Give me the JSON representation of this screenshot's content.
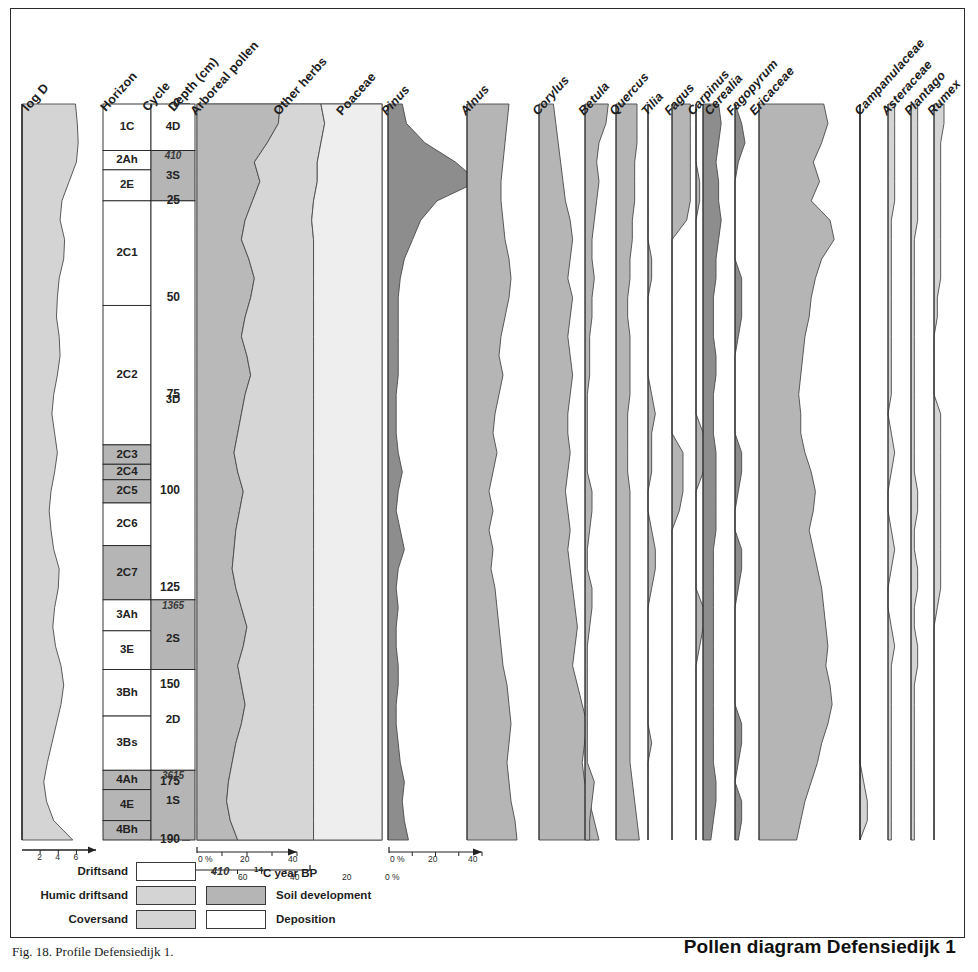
{
  "figure": {
    "title": "Pollen diagram Defensiedijk 1",
    "caption": "Fig. 18. Profile Defensiedijk 1.",
    "width": 978,
    "height": 972
  },
  "colors": {
    "arboreal_fill": "#b9b9b9",
    "herbs_fill": "#d6d6d6",
    "poaceae_fill": "#eeeeee",
    "dark_fill": "#8d8d8d",
    "mid_fill": "#b5b5b5",
    "light_fill": "#d4d4d4",
    "white_fill": "#ffffff",
    "stroke": "#4a4a4a",
    "axis": "#222222"
  },
  "depth_axis": {
    "label": "Depth (cm)",
    "unit": "cm",
    "min": 0,
    "max": 190,
    "ticks": [
      0,
      25,
      50,
      75,
      100,
      125,
      150,
      175,
      190
    ],
    "minor_step": 5
  },
  "logd_axis": {
    "label": "log D",
    "ticks": [
      2,
      4,
      6
    ],
    "min": 0,
    "max": 7.5
  },
  "percent_axes": [
    {
      "name": "sum-axis-left",
      "labels": [
        "0 %",
        "20",
        "40"
      ],
      "direction": "right"
    },
    {
      "name": "sum-axis-reverse",
      "labels": [
        "60",
        "40",
        "20",
        "0 %"
      ],
      "direction": "left"
    },
    {
      "name": "pinus-axis",
      "labels": [
        "0 %",
        "20",
        "40"
      ],
      "direction": "right"
    }
  ],
  "strat_columns": {
    "horizon_header": "Horizon",
    "cycle_header": "Cycle",
    "horizons": [
      {
        "label": "1C",
        "top": 0,
        "bottom": 12,
        "fill": "white"
      },
      {
        "label": "2Ah",
        "top": 12,
        "bottom": 17,
        "fill": "white"
      },
      {
        "label": "2E",
        "top": 17,
        "bottom": 25,
        "fill": "white"
      },
      {
        "label": "2C1",
        "top": 25,
        "bottom": 52,
        "fill": "white"
      },
      {
        "label": "2C2",
        "top": 52,
        "bottom": 88,
        "fill": "white"
      },
      {
        "label": "2C3",
        "top": 88,
        "bottom": 93,
        "fill": "grey"
      },
      {
        "label": "2C4",
        "top": 93,
        "bottom": 97,
        "fill": "grey"
      },
      {
        "label": "2C5",
        "top": 97,
        "bottom": 103,
        "fill": "grey"
      },
      {
        "label": "2C6",
        "top": 103,
        "bottom": 114,
        "fill": "white"
      },
      {
        "label": "2C7",
        "top": 114,
        "bottom": 128,
        "fill": "grey"
      },
      {
        "label": "3Ah",
        "top": 128,
        "bottom": 136,
        "fill": "white"
      },
      {
        "label": "3E",
        "top": 136,
        "bottom": 146,
        "fill": "white"
      },
      {
        "label": "3Bh",
        "top": 146,
        "bottom": 158,
        "fill": "white"
      },
      {
        "label": "3Bs",
        "top": 158,
        "bottom": 172,
        "fill": "white"
      },
      {
        "label": "4Ah",
        "top": 172,
        "bottom": 177,
        "fill": "grey"
      },
      {
        "label": "4E",
        "top": 177,
        "bottom": 185,
        "fill": "grey"
      },
      {
        "label": "4Bh",
        "top": 185,
        "bottom": 190,
        "fill": "grey"
      }
    ],
    "cycles": [
      {
        "label": "4D",
        "top": 0,
        "bottom": 12,
        "fill": "white"
      },
      {
        "label": "3S",
        "top": 12,
        "bottom": 25,
        "fill": "grey"
      },
      {
        "label": "3D",
        "top": 25,
        "bottom": 128,
        "fill": "white"
      },
      {
        "label": "2S",
        "top": 128,
        "bottom": 146,
        "fill": "grey"
      },
      {
        "label": "2D",
        "top": 146,
        "bottom": 172,
        "fill": "white"
      },
      {
        "label": "1S",
        "top": 172,
        "bottom": 190,
        "fill": "grey"
      }
    ],
    "c14_dates": [
      {
        "value": "410",
        "depth": 13.5
      },
      {
        "value": "1365",
        "depth": 129.5
      },
      {
        "value": "3615",
        "depth": 173.5
      }
    ]
  },
  "legend": {
    "rows": [
      {
        "left_label": "Driftsand",
        "left_fill": "white",
        "right_fill": null,
        "right_label": ""
      },
      {
        "left_label": "Humic driftsand",
        "left_fill": "light",
        "right_fill": "mid",
        "right_label": "Soil development"
      },
      {
        "left_label": "Coversand",
        "left_fill": "light",
        "right_fill": "white",
        "right_label": "Deposition"
      }
    ],
    "c14_value": "410",
    "c14_label": "14C year BP",
    "c14_sup": "14"
  },
  "chart_data": {
    "type": "area",
    "title": "Pollen diagram Defensiedijk 1",
    "xlabel": "percentage (%)",
    "ylabel": "Depth (cm)",
    "ylim": [
      0,
      190
    ],
    "y_inverted": true,
    "depths": [
      0,
      5,
      10,
      15,
      20,
      25,
      30,
      35,
      40,
      45,
      50,
      55,
      60,
      65,
      70,
      75,
      80,
      85,
      90,
      95,
      100,
      105,
      110,
      115,
      120,
      125,
      130,
      135,
      140,
      145,
      150,
      155,
      160,
      165,
      170,
      175,
      180,
      185,
      190
    ],
    "curves": [
      {
        "name": "log D",
        "group": "sediment",
        "kind": "line-area",
        "fill": "light",
        "max": 7.5,
        "values": [
          5.9,
          6.1,
          6.2,
          6.0,
          5.2,
          4.4,
          4.2,
          4.7,
          4.6,
          4.1,
          3.9,
          3.8,
          4.1,
          4.2,
          3.9,
          3.5,
          3.3,
          3.6,
          3.9,
          3.6,
          3.2,
          3.0,
          3.2,
          3.5,
          4.1,
          4.0,
          3.6,
          3.4,
          3.7,
          4.3,
          4.6,
          4.3,
          3.8,
          3.3,
          2.8,
          2.4,
          2.7,
          3.5,
          5.6
        ]
      },
      {
        "name": "Arboreal pollen",
        "group": "sum",
        "kind": "cumulative",
        "fill": "arboreal",
        "max": 100,
        "values": [
          45,
          44,
          38,
          31,
          34,
          30,
          26,
          24,
          28,
          31,
          29,
          26,
          24,
          27,
          29,
          26,
          24,
          22,
          20,
          22,
          25,
          23,
          21,
          20,
          19,
          21,
          24,
          27,
          25,
          22,
          24,
          26,
          24,
          21,
          19,
          17,
          16,
          18,
          22
        ]
      },
      {
        "name": "Other herbs",
        "group": "sum",
        "kind": "cumulative",
        "fill": "herbs",
        "max": 100,
        "values": [
          22,
          25,
          29,
          34,
          31,
          33,
          36,
          39,
          35,
          32,
          34,
          37,
          39,
          36,
          34,
          37,
          39,
          41,
          43,
          41,
          38,
          40,
          42,
          43,
          44,
          42,
          39,
          36,
          38,
          41,
          39,
          37,
          39,
          42,
          44,
          46,
          47,
          45,
          41
        ]
      },
      {
        "name": "Poaceae",
        "group": "sum",
        "kind": "cumulative",
        "fill": "poaceae",
        "max": 100,
        "values": [
          33,
          31,
          33,
          35,
          35,
          37,
          38,
          37,
          37,
          37,
          37,
          37,
          37,
          37,
          37,
          37,
          37,
          37,
          37,
          37,
          37,
          37,
          37,
          37,
          37,
          37,
          37,
          37,
          37,
          37,
          37,
          37,
          37,
          37,
          37,
          37,
          37,
          37,
          37
        ]
      },
      {
        "name": "Pinus",
        "group": "tree",
        "kind": "silhouette",
        "fill": "dark",
        "max": 45,
        "values": [
          7,
          9,
          18,
          33,
          44,
          24,
          16,
          12,
          8,
          6,
          5,
          5,
          5,
          5,
          5,
          4,
          4,
          4,
          5,
          7,
          5,
          4,
          6,
          8,
          5,
          4,
          5,
          4,
          4,
          5,
          5,
          4,
          4,
          5,
          6,
          8,
          7,
          8,
          10
        ]
      },
      {
        "name": "Alnus",
        "group": "tree",
        "kind": "silhouette",
        "fill": "mid",
        "max": 30,
        "values": [
          21,
          20,
          19,
          18,
          17,
          17,
          18,
          19,
          21,
          22,
          21,
          19,
          17,
          16,
          18,
          16,
          14,
          13,
          15,
          13,
          11,
          13,
          11,
          13,
          12,
          14,
          15,
          16,
          17,
          18,
          20,
          21,
          22,
          21,
          20,
          21,
          22,
          24,
          25
        ]
      },
      {
        "name": "Corylus",
        "group": "tree",
        "kind": "silhouette",
        "fill": "mid",
        "max": 25,
        "values": [
          6,
          7,
          8,
          9,
          10,
          11,
          13,
          14,
          13,
          12,
          14,
          13,
          12,
          13,
          14,
          13,
          12,
          12,
          13,
          12,
          11,
          12,
          13,
          12,
          13,
          14,
          15,
          16,
          15,
          14,
          16,
          18,
          20,
          19,
          18,
          19,
          21,
          23,
          25
        ]
      },
      {
        "name": "Betula",
        "group": "tree",
        "kind": "silhouette",
        "fill": "mid",
        "max": 12,
        "values": [
          10,
          9,
          6,
          5,
          6,
          5,
          4,
          3,
          3,
          4,
          3,
          3,
          2,
          2,
          2,
          1,
          1,
          1,
          1,
          1,
          3,
          3,
          2,
          1,
          1,
          3,
          3,
          2,
          1,
          1,
          1,
          1,
          1,
          1,
          1,
          4,
          3,
          2,
          2
        ]
      },
      {
        "name": "Quercus",
        "group": "tree",
        "kind": "silhouette",
        "fill": "mid",
        "max": 12,
        "values": [
          9,
          9,
          9,
          8,
          8,
          8,
          7,
          7,
          6,
          6,
          5,
          5,
          6,
          6,
          6,
          6,
          5,
          5,
          5,
          5,
          6,
          6,
          6,
          6,
          6,
          6,
          6,
          6,
          6,
          6,
          6,
          6,
          6,
          6,
          6,
          7,
          8,
          9,
          10
        ]
      },
      {
        "name": "Tilia",
        "group": "tree",
        "kind": "silhouette",
        "fill": "mid",
        "max": 6,
        "values": [
          0,
          0,
          0,
          0,
          0,
          0,
          0,
          0,
          1,
          1,
          0,
          0,
          0,
          0,
          0,
          1,
          2,
          1,
          1,
          1,
          0,
          0,
          1,
          2,
          2,
          1,
          0,
          0,
          0,
          0,
          0,
          0,
          0,
          1,
          0,
          0,
          0,
          0,
          0
        ]
      },
      {
        "name": "Fagus",
        "group": "tree",
        "kind": "silhouette",
        "fill": "mid",
        "max": 6,
        "values": [
          5,
          5,
          5,
          5,
          5,
          5,
          4,
          0,
          0,
          0,
          0,
          0,
          0,
          0,
          0,
          0,
          0,
          0,
          3,
          3,
          3,
          2,
          0,
          0,
          0,
          0,
          0,
          0,
          0,
          0,
          0,
          0,
          0,
          0,
          0,
          0,
          0,
          0,
          0
        ]
      },
      {
        "name": "Carpinus",
        "group": "tree",
        "kind": "silhouette",
        "fill": "mid",
        "max": 6,
        "values": [
          0,
          0,
          0,
          0,
          1,
          1,
          0,
          0,
          0,
          0,
          0,
          0,
          0,
          0,
          0,
          0,
          0,
          2,
          3,
          2,
          0,
          0,
          0,
          0,
          0,
          0,
          2,
          2,
          1,
          0,
          0,
          0,
          0,
          0,
          0,
          0,
          0,
          0,
          0
        ]
      },
      {
        "name": "Cerealia",
        "group": "herb",
        "kind": "silhouette",
        "fill": "dark",
        "max": 10,
        "values": [
          6,
          7,
          6,
          5,
          6,
          6,
          7,
          6,
          5,
          5,
          4,
          4,
          4,
          5,
          5,
          4,
          4,
          4,
          5,
          5,
          5,
          5,
          5,
          4,
          4,
          4,
          4,
          4,
          4,
          4,
          4,
          4,
          4,
          4,
          4,
          5,
          5,
          4,
          3
        ]
      },
      {
        "name": "Fagopyrum",
        "group": "herb",
        "kind": "silhouette",
        "fill": "dark",
        "max": 6,
        "values": [
          0,
          2,
          3,
          1,
          0,
          0,
          0,
          0,
          0,
          2,
          2,
          2,
          1,
          0,
          0,
          0,
          0,
          0,
          2,
          2,
          1,
          0,
          0,
          2,
          2,
          1,
          0,
          0,
          0,
          0,
          0,
          0,
          2,
          2,
          1,
          0,
          2,
          2,
          1
        ]
      },
      {
        "name": "Ericaceae",
        "group": "herb",
        "kind": "silhouette",
        "fill": "mid",
        "max": 45,
        "values": [
          31,
          33,
          30,
          26,
          29,
          25,
          34,
          36,
          30,
          27,
          25,
          24,
          22,
          21,
          20,
          19,
          20,
          20,
          22,
          25,
          27,
          26,
          24,
          26,
          28,
          30,
          31,
          32,
          33,
          32,
          34,
          35,
          33,
          30,
          28,
          25,
          22,
          20,
          18
        ]
      },
      {
        "name": "Campanulaceae",
        "group": "herb",
        "kind": "silhouette",
        "fill": "light",
        "max": 6,
        "values": [
          0,
          0,
          0,
          0,
          0,
          0,
          0,
          0,
          0,
          0,
          0,
          0,
          0,
          0,
          0,
          0,
          0,
          0,
          0,
          0,
          0,
          0,
          0,
          0,
          0,
          0,
          0,
          0,
          0,
          0,
          0,
          0,
          0,
          0,
          0,
          1,
          2,
          2,
          0
        ]
      },
      {
        "name": "Asteraceae",
        "group": "herb",
        "kind": "silhouette",
        "fill": "light",
        "max": 6,
        "values": [
          2,
          2,
          2,
          2,
          2,
          2,
          1,
          1,
          1,
          1,
          1,
          1,
          1,
          1,
          1,
          1,
          0,
          1,
          2,
          1,
          0,
          0,
          1,
          2,
          1,
          0,
          0,
          1,
          2,
          1,
          1,
          1,
          1,
          1,
          1,
          1,
          1,
          1,
          1
        ]
      },
      {
        "name": "Plantago",
        "group": "herb",
        "kind": "silhouette",
        "fill": "light",
        "max": 6,
        "values": [
          2,
          2,
          2,
          2,
          2,
          2,
          2,
          1,
          1,
          1,
          1,
          1,
          1,
          1,
          1,
          1,
          1,
          1,
          1,
          1,
          2,
          2,
          1,
          1,
          2,
          2,
          1,
          1,
          2,
          2,
          1,
          1,
          1,
          1,
          1,
          1,
          1,
          1,
          1
        ]
      },
      {
        "name": "Rumex",
        "group": "herb",
        "kind": "silhouette",
        "fill": "light",
        "max": 6,
        "values": [
          3,
          3,
          2,
          2,
          2,
          2,
          2,
          2,
          2,
          2,
          1,
          1,
          0,
          0,
          0,
          0,
          2,
          2,
          2,
          2,
          2,
          2,
          2,
          2,
          2,
          2,
          1,
          0,
          0,
          0,
          0,
          0,
          0,
          0,
          0,
          0,
          0,
          0,
          0
        ]
      }
    ],
    "legend_entries": [
      "Driftsand",
      "Humic driftsand",
      "Coversand",
      "Soil development",
      "Deposition"
    ]
  }
}
